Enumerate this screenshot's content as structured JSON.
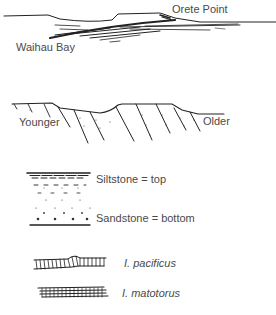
{
  "panel1": {
    "title": "Cross-section: Waihau Bay to Orete Point",
    "labels": {
      "right": "Orete Point",
      "left": "Waihau Bay"
    }
  },
  "panel2": {
    "title": "Tilted strata younging direction",
    "labels": {
      "left": "Younger",
      "right": "Older"
    }
  },
  "panel3": {
    "title": "Graded bedding way-up indicator",
    "labels": {
      "top": "Siltstone = top",
      "bottom": "Sandstone = bottom"
    }
  },
  "panel4": {
    "title": "Inoceramus fossil shells",
    "labels": {
      "species1": "I. pacificus",
      "species2": "I. matotorus"
    }
  },
  "colors": {
    "ink": "#222222",
    "text": "#4a4a4a",
    "background": "#ffffff"
  }
}
